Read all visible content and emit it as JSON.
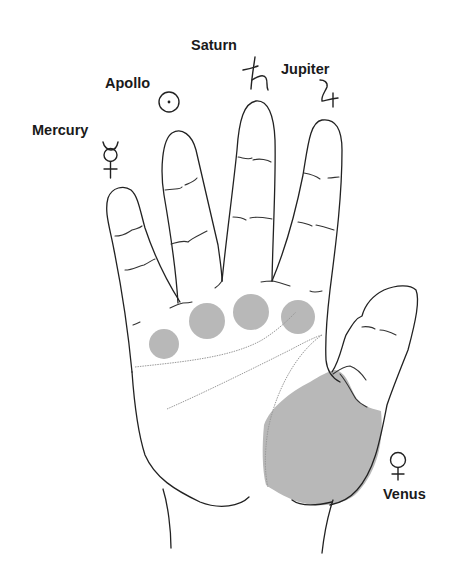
{
  "diagram": {
    "type": "palmistry-hand-mounts",
    "mount_fill_color": "#b8b8b8",
    "outline_color": "#222222",
    "palm_line_color": "#9a9a9a"
  },
  "labels": {
    "mercury": {
      "text": "Mercury",
      "glyph": "☿",
      "icon": "mercury-symbol-icon",
      "finger": "little finger"
    },
    "apollo": {
      "text": "Apollo",
      "glyph": "☉",
      "icon": "sun-symbol-icon",
      "finger": "ring finger"
    },
    "saturn": {
      "text": "Saturn",
      "glyph": "♄",
      "icon": "saturn-symbol-icon",
      "finger": "middle finger"
    },
    "jupiter": {
      "text": "Jupiter",
      "glyph": "♃",
      "icon": "jupiter-symbol-icon",
      "finger": "index finger"
    },
    "venus": {
      "text": "Venus",
      "glyph": "♀",
      "icon": "venus-symbol-icon",
      "finger": "thumb base"
    }
  },
  "mounts": [
    {
      "name": "Mercury",
      "cx": 164,
      "cy": 344,
      "r": 15
    },
    {
      "name": "Apollo",
      "cx": 207,
      "cy": 321,
      "r": 18
    },
    {
      "name": "Saturn",
      "cx": 251,
      "cy": 312,
      "r": 18
    },
    {
      "name": "Jupiter",
      "cx": 298,
      "cy": 317,
      "r": 17
    },
    {
      "name": "Venus",
      "shape": "large shaded area at base of thumb"
    }
  ]
}
